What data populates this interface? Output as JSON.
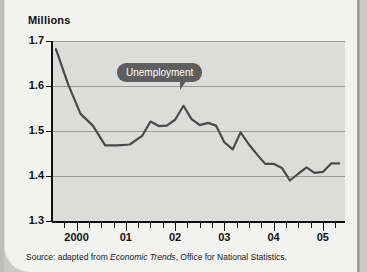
{
  "card": {
    "y_axis_title": "Millions",
    "source_prefix": "Source: adapted from ",
    "source_italic": "Economic Trends",
    "source_suffix": ", Office for National Statistics."
  },
  "callout": {
    "label": "Unemployment"
  },
  "colors": {
    "plot_background": "#dcdcda",
    "line": "#4a4a4a",
    "callout_background": "#5e5e5e",
    "callout_text": "#ffffff",
    "gridline": "#9a9a98",
    "axis": "#111111",
    "card_background": "#f2f2f0"
  },
  "chart_data": {
    "type": "line",
    "title": "",
    "subtitle": "",
    "xlabel": "",
    "ylabel": "Millions",
    "ylim": [
      1.3,
      1.7
    ],
    "yticks": [
      1.3,
      1.4,
      1.5,
      1.6,
      1.7
    ],
    "ytick_labels": [
      "1.3",
      "1.4",
      "1.5",
      "1.6",
      "1.7"
    ],
    "grid": true,
    "legend": "none",
    "annotations": [
      {
        "text": "Unemployment",
        "style": "callout-bubble",
        "points_to": "2002 peak"
      }
    ],
    "xtick_labels": [
      "2000",
      "01",
      "02",
      "03",
      "04",
      "05"
    ],
    "x_major_positions": [
      2000,
      2001,
      2002,
      2003,
      2004,
      2005
    ],
    "x_minor_interval": 0.25,
    "xlim": [
      1999.5,
      2005.45
    ],
    "series": [
      {
        "name": "Unemployment",
        "units": "millions",
        "x": [
          1999.58,
          1999.83,
          2000.08,
          2000.33,
          2000.58,
          2000.83,
          2001.08,
          2001.33,
          2001.5,
          2001.67,
          2001.83,
          2002.0,
          2002.17,
          2002.33,
          2002.5,
          2002.67,
          2002.83,
          2003.0,
          2003.17,
          2003.33,
          2003.5,
          2003.67,
          2003.83,
          2004.0,
          2004.17,
          2004.33,
          2004.5,
          2004.67,
          2004.83,
          2005.0,
          2005.17,
          2005.33
        ],
        "values": [
          1.682,
          1.603,
          1.538,
          1.512,
          1.468,
          1.468,
          1.47,
          1.489,
          1.521,
          1.511,
          1.512,
          1.525,
          1.556,
          1.527,
          1.513,
          1.518,
          1.512,
          1.475,
          1.459,
          1.497,
          1.47,
          1.447,
          1.427,
          1.427,
          1.418,
          1.39,
          1.405,
          1.419,
          1.407,
          1.409,
          1.428,
          1.428
        ]
      }
    ]
  }
}
